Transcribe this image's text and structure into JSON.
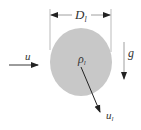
{
  "diagram": {
    "droplet": {
      "fill": "#c8c8c8",
      "density_label": "ρ",
      "density_subscript": "l"
    },
    "diameter": {
      "label": "D",
      "subscript": "l"
    },
    "inflow": {
      "label": "u"
    },
    "gravity": {
      "label": "g"
    },
    "droplet_velocity": {
      "label": "u",
      "subscript": "l"
    },
    "colors": {
      "line": "#222222",
      "guide": "#aaaaaa",
      "text": "#333333"
    }
  }
}
